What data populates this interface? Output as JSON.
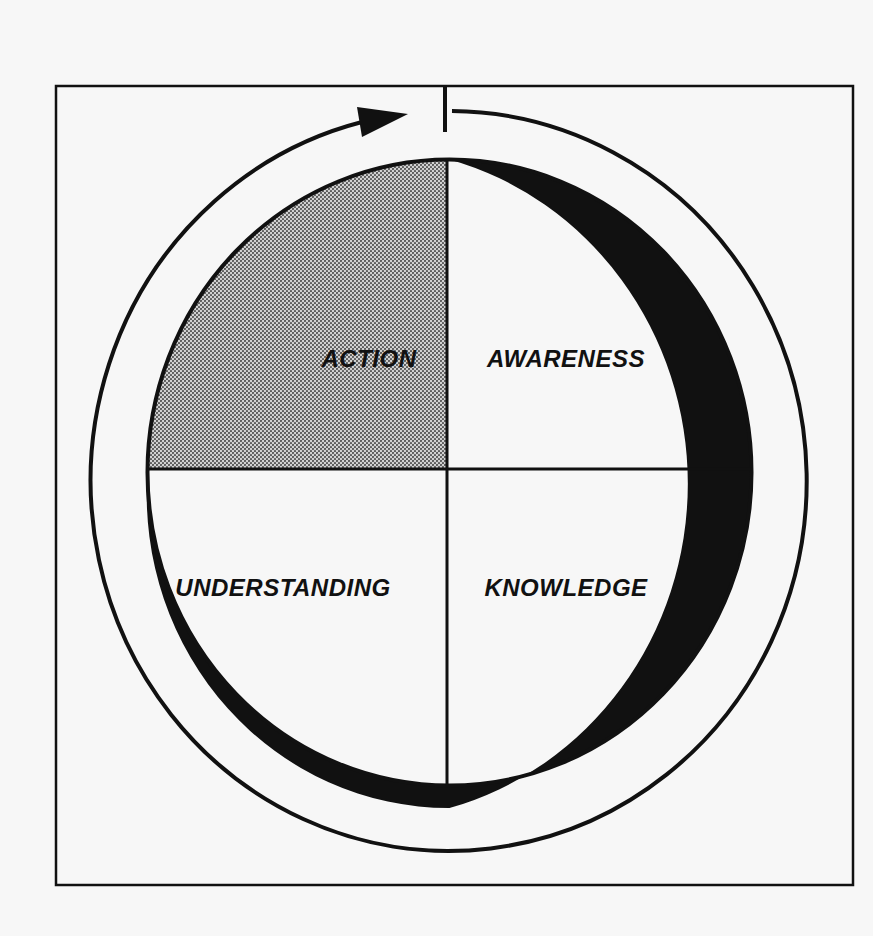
{
  "diagram": {
    "type": "cycle-quadrant",
    "quadrants": [
      {
        "position": "top-left",
        "label": "ACTION",
        "shaded": true
      },
      {
        "position": "top-right",
        "label": "AWARENESS",
        "shaded": false
      },
      {
        "position": "bottom-left",
        "label": "UNDERSTANDING",
        "shaded": false
      },
      {
        "position": "bottom-right",
        "label": "KNOWLEDGE",
        "shaded": false
      }
    ],
    "cycle_direction": "clockwise",
    "colors": {
      "background": "#f7f7f7",
      "ink": "#111111",
      "shade": "#b5b5b5"
    }
  }
}
